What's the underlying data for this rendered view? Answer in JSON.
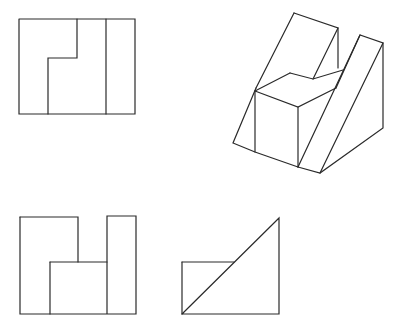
{
  "figure": {
    "stroke_color": "#2a2a2a",
    "background": "#ffffff",
    "views": [
      {
        "name": "top-view",
        "position": "top-left",
        "lines": [
          [
            [
              19,
              19
            ],
            [
              135,
              19
            ],
            [
              135,
              114
            ],
            [
              19,
              114
            ],
            [
              19,
              19
            ]
          ],
          [
            [
              106,
              19
            ],
            [
              106,
              114
            ]
          ],
          [
            [
              77,
              19
            ],
            [
              77,
              58
            ],
            [
              48,
              58
            ],
            [
              48,
              114
            ]
          ]
        ]
      },
      {
        "name": "front-view",
        "position": "bottom-left",
        "lines": [
          [
            [
              20,
              217
            ],
            [
              78,
              217
            ],
            [
              78,
              262
            ]
          ],
          [
            [
              20,
              217
            ],
            [
              20,
              314
            ],
            [
              136,
              314
            ],
            [
              136,
              216
            ],
            [
              107,
              216
            ],
            [
              107,
              314
            ]
          ],
          [
            [
              50,
              262
            ],
            [
              107,
              262
            ]
          ],
          [
            [
              50,
              262
            ],
            [
              50,
              314
            ]
          ]
        ]
      },
      {
        "name": "side-view",
        "position": "bottom-right",
        "lines": [
          [
            [
              182,
              314
            ],
            [
              279,
              218
            ],
            [
              279,
              314
            ],
            [
              182,
              314
            ]
          ],
          [
            [
              182,
              262
            ],
            [
              234,
              262
            ]
          ],
          [
            [
              182,
              262
            ],
            [
              182,
              314
            ]
          ]
        ]
      },
      {
        "name": "isometric-view",
        "position": "top-right",
        "lines": [
          [
            [
              294,
              13
            ],
            [
              338,
              28
            ],
            [
              338,
              68
            ]
          ],
          [
            [
              294,
              13
            ],
            [
              256,
              88
            ]
          ],
          [
            [
              338,
              28
            ],
            [
              313,
              79
            ]
          ],
          [
            [
              290,
              73
            ],
            [
              313,
              79
            ],
            [
              343,
              70
            ]
          ],
          [
            [
              290,
              73
            ],
            [
              255,
              91
            ]
          ],
          [
            [
              255,
              91
            ],
            [
              298,
              107
            ],
            [
              336,
              88
            ]
          ],
          [
            [
              255,
              91
            ],
            [
              255,
              152
            ]
          ],
          [
            [
              298,
              107
            ],
            [
              298,
              167
            ]
          ],
          [
            [
              256,
              88
            ],
            [
              233,
              143
            ],
            [
              255,
              152
            ],
            [
              298,
              167
            ]
          ],
          [
            [
              298,
              167
            ],
            [
              320,
              173
            ],
            [
              383,
              128
            ],
            [
              383,
              43
            ],
            [
              360,
              35
            ],
            [
              336,
              88
            ]
          ],
          [
            [
              360,
              35
            ],
            [
              298,
              167
            ]
          ],
          [
            [
              383,
              43
            ],
            [
              320,
              173
            ]
          ]
        ]
      }
    ]
  }
}
